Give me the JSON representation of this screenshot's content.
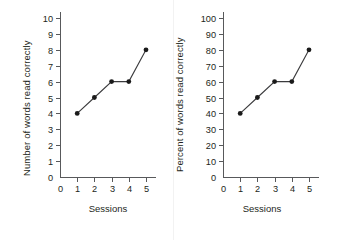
{
  "figure": {
    "background_color": "#ffffff",
    "ink_color": "#231f20",
    "axis_color": "#58595b",
    "line_color": "#3b3b3d",
    "marker_color": "#1a1a1a"
  },
  "chart_data": [
    {
      "type": "line",
      "title": "",
      "xlabel": "Sessions",
      "ylabel": "Number of words read correctly",
      "x": [
        1,
        2,
        3,
        4,
        5
      ],
      "values": [
        4,
        5,
        6,
        6,
        8
      ],
      "xlim": [
        0,
        5.6
      ],
      "ylim": [
        0,
        10
      ],
      "xticks": [
        0,
        1,
        2,
        3,
        4,
        5
      ],
      "yticks": [
        0,
        1,
        2,
        3,
        4,
        5,
        6,
        7,
        8,
        9,
        10
      ],
      "xticklabels": [
        "0",
        "1",
        "2",
        "3",
        "4",
        "5"
      ],
      "yticklabels": [
        "0",
        "1",
        "2",
        "3",
        "4",
        "5",
        "6",
        "7",
        "8",
        "9",
        "10"
      ],
      "grid": false,
      "legend": false,
      "marker": "filled-circle"
    },
    {
      "type": "line",
      "title": "",
      "xlabel": "Sessions",
      "ylabel": "Percent of words read correctly",
      "x": [
        1,
        2,
        3,
        4,
        5
      ],
      "values": [
        40,
        50,
        60,
        60,
        80
      ],
      "xlim": [
        0,
        5.6
      ],
      "ylim": [
        0,
        100
      ],
      "xticks": [
        0,
        1,
        2,
        3,
        4,
        5
      ],
      "yticks": [
        0,
        10,
        20,
        30,
        40,
        50,
        60,
        70,
        80,
        90,
        100
      ],
      "xticklabels": [
        "0",
        "1",
        "2",
        "3",
        "4",
        "5"
      ],
      "yticklabels": [
        "0",
        "10",
        "20",
        "30",
        "40",
        "50",
        "60",
        "70",
        "80",
        "90",
        "100"
      ],
      "grid": false,
      "legend": false,
      "marker": "filled-circle"
    }
  ],
  "panels": [
    {
      "name": "left-chart",
      "ylabel": "Number of words read correctly",
      "xlabel": "Sessions"
    },
    {
      "name": "right-chart",
      "ylabel": "Percent of words read correctly",
      "xlabel": "Sessions"
    }
  ]
}
